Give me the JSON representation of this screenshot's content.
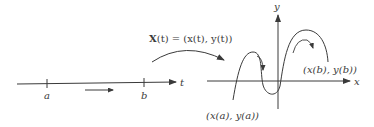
{
  "diagram": {
    "map_label": {
      "bold_part": "X",
      "rest": "(t) = (x(t), y(t))"
    },
    "left_axis": {
      "axis_label": "t",
      "tick_a": "a",
      "tick_b": "b",
      "direction_arrow": "right"
    },
    "right_plot": {
      "x_axis_label": "x",
      "y_axis_label": "y",
      "start_point_label": "(x(a), y(a))",
      "end_point_label": "(x(b), y(b))"
    },
    "colors": {
      "line": "#3a3a3a",
      "background": "#ffffff"
    }
  }
}
